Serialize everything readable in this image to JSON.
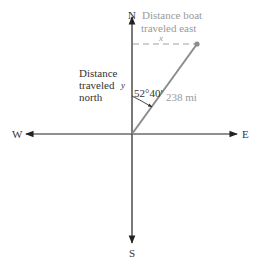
{
  "compass": {
    "north": "N",
    "south": "S",
    "east": "E",
    "west": "W"
  },
  "labels": {
    "east_distance_line1": "Distance boat",
    "east_distance_line2": "traveled east",
    "east_variable": "x",
    "north_distance_line1": "Distance",
    "north_distance_line2": "traveled",
    "north_distance_line3": "north",
    "north_variable": "y",
    "angle": "52°40′",
    "hypotenuse": "238 mi"
  },
  "colors": {
    "axis": "#222222",
    "path": "#8c8c8c",
    "dashed": "#a0a0a0",
    "gray_text": "#9a9a9a",
    "dark_text": "#333333"
  }
}
